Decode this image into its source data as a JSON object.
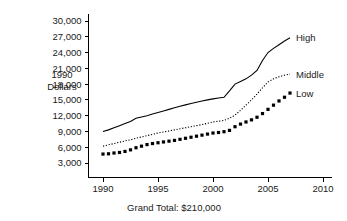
{
  "chart_data": {
    "type": "line",
    "title": "",
    "xlabel": "",
    "ylabel": "1990 Dollars",
    "ylabel_lines": [
      "1990",
      "Dollars"
    ],
    "xlim": [
      1989,
      2010.5
    ],
    "ylim": [
      2200,
      31000
    ],
    "grid": false,
    "legend_position": "right-inline",
    "xticks": [
      1990,
      1995,
      2000,
      2005,
      2010
    ],
    "xtick_labels": [
      "1990",
      "1995",
      "2000",
      "2005",
      "2010"
    ],
    "yticks": [
      3000,
      6000,
      9000,
      12000,
      15000,
      18000,
      21000,
      24000,
      27000,
      30000
    ],
    "ytick_labels": [
      "3,000",
      "6,000",
      "9,000",
      "12,000",
      "15,000",
      "18,000",
      "21,000",
      "24,000",
      "27,000",
      "30,000"
    ],
    "footnote": "Grand Total: $210,000",
    "x": [
      1990,
      1990.5,
      1991,
      1991.5,
      1992,
      1992.5,
      1993,
      1993.5,
      1994,
      1994.5,
      1995,
      1995.5,
      1996,
      1996.5,
      1997,
      1997.5,
      1998,
      1998.5,
      1999,
      1999.5,
      2000,
      2000.5,
      2001,
      2001.5,
      2002,
      2002.5,
      2003,
      2003.5,
      2004,
      2004.5,
      2005,
      2005.5,
      2006,
      2006.5,
      2007
    ],
    "series": [
      {
        "name": "High",
        "style": "solid",
        "color": "#000000",
        "values": [
          9000,
          9300,
          9700,
          10100,
          10500,
          10900,
          11500,
          11750,
          12000,
          12300,
          12600,
          12900,
          13200,
          13500,
          13800,
          14050,
          14300,
          14550,
          14800,
          15000,
          15200,
          15350,
          15500,
          16700,
          18000,
          18500,
          19000,
          19700,
          20600,
          22500,
          24000,
          24800,
          25500,
          26200,
          26800
        ]
      },
      {
        "name": "Middle",
        "style": "dotted",
        "color": "#000000",
        "values": [
          6200,
          6450,
          6700,
          6950,
          7200,
          7400,
          7700,
          7950,
          8200,
          8450,
          8700,
          8900,
          9100,
          9300,
          9500,
          9700,
          9900,
          10100,
          10300,
          10550,
          10800,
          10950,
          11100,
          11500,
          12100,
          13000,
          14000,
          15000,
          16100,
          17300,
          18400,
          19000,
          19400,
          19700,
          19900
        ]
      },
      {
        "name": "Low",
        "style": "markers",
        "color": "#000000",
        "values": [
          4700,
          4750,
          4900,
          5000,
          5200,
          5500,
          5900,
          6200,
          6500,
          6700,
          6850,
          7000,
          7150,
          7300,
          7500,
          7700,
          7900,
          8100,
          8300,
          8500,
          8700,
          8800,
          8950,
          9200,
          9900,
          10400,
          10800,
          11200,
          11700,
          12400,
          13200,
          14000,
          14800,
          15500,
          16300
        ]
      }
    ]
  },
  "labels": {
    "high": "High",
    "middle": "Middle",
    "low": "Low"
  }
}
